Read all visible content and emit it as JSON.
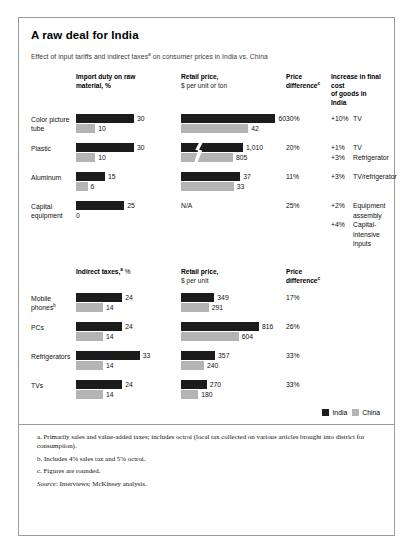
{
  "title": "A raw deal for India",
  "subtitle_parts": {
    "before": "Effect of input tariffs and indirect taxes",
    "sup": "a",
    "after": " on consumer prices in India vs. China"
  },
  "legend": {
    "india_label": "India",
    "china_label": "China",
    "india_color": "#1c1c1c",
    "china_color": "#b4b4b4"
  },
  "section1": {
    "headers": {
      "label": "",
      "bar_a_line1": "Import duty on raw",
      "bar_a_line2": "material, %",
      "bar_b_line1": "Retail price,",
      "bar_b_line2": "$ per unit or ton",
      "diff_line1": "Price",
      "diff_line2": "difference",
      "diff_sup": "c",
      "incr_line1": "Increase in final cost",
      "incr_line2": "of goods in India"
    },
    "rows": [
      {
        "label_line1": "Color picture",
        "label_line2": "tube",
        "duty_india": "30",
        "duty_china": "10",
        "retail_india": "60",
        "retail_china": "42",
        "difference": "30%",
        "increases": [
          {
            "pct": "+10%",
            "text": "TV"
          }
        ]
      },
      {
        "label_line1": "Plastic",
        "label_line2": "",
        "duty_india": "30",
        "duty_china": "10",
        "retail_india": "1,010",
        "retail_china": "805",
        "difference": "20%",
        "increases": [
          {
            "pct": "+1%",
            "text": "TV"
          },
          {
            "pct": "+3%",
            "text": "Refrigerator"
          }
        ]
      },
      {
        "label_line1": "Aluminum",
        "label_line2": "",
        "duty_india": "15",
        "duty_china": "6",
        "retail_india": "37",
        "retail_china": "33",
        "difference": "11%",
        "increases": [
          {
            "pct": "+3%",
            "text": "TV/refrigerator"
          }
        ]
      },
      {
        "label_line1": "Capital",
        "label_line2": "equipment",
        "duty_india": "25",
        "duty_china": "0",
        "retail_na": "N/A",
        "difference": "25%",
        "increases": [
          {
            "pct": "+2%",
            "text": "Equipment assembly"
          },
          {
            "pct": "+4%",
            "text": "Capital-intensive inputs"
          }
        ]
      }
    ]
  },
  "section2": {
    "headers": {
      "bar_a_line1": "Indirect taxes,",
      "bar_a_sup": "a",
      "bar_a_unit": " %",
      "bar_b_line1": "Retail price,",
      "bar_b_line2": "$ per unit",
      "diff_line1": "Price",
      "diff_line2": "difference",
      "diff_sup": "c"
    },
    "rows": [
      {
        "label_line1": "Mobile",
        "label_line2": "phones",
        "label_sup": "b",
        "tax_india": "24",
        "tax_china": "14",
        "retail_india": "349",
        "retail_china": "291",
        "difference": "17%"
      },
      {
        "label_line1": "PCs",
        "label_line2": "",
        "tax_india": "24",
        "tax_china": "14",
        "retail_india": "816",
        "retail_china": "604",
        "difference": "26%"
      },
      {
        "label_line1": "Refrigerators",
        "label_line2": "",
        "tax_india": "33",
        "tax_china": "14",
        "retail_india": "357",
        "retail_china": "240",
        "difference": "33%"
      },
      {
        "label_line1": "TVs",
        "label_line2": "",
        "tax_india": "24",
        "tax_china": "14",
        "retail_india": "270",
        "retail_china": "180",
        "difference": "33%"
      }
    ]
  },
  "footnotes": {
    "a": "a. Primarily sales and value-added taxes; includes octroi (local tax collected on various articles brought into district for consumption).",
    "b": "b. Includes 4% sales tax and 5% octroi.",
    "c": "c. Figures are rounded.",
    "source_label": "Source",
    "source_text": ": Interviews; McKinsey analysis."
  },
  "chart_data": {
    "type": "bar",
    "title": "A raw deal for India",
    "subtitle": "Effect of input tariffs and indirect taxes(a) on consumer prices in India vs. China",
    "series_names": [
      "India",
      "China"
    ],
    "legend_position": "bottom-right",
    "grid": false,
    "panels": [
      {
        "name": "Input tariffs on raw materials",
        "categories": [
          "Color picture tube",
          "Plastic",
          "Aluminum",
          "Capital equipment"
        ],
        "measures": [
          {
            "name": "Import duty on raw material, %",
            "unit": "%",
            "series": [
              {
                "name": "India",
                "values": [
                  30,
                  30,
                  15,
                  25
                ]
              },
              {
                "name": "China",
                "values": [
                  10,
                  10,
                  6,
                  0
                ]
              }
            ]
          },
          {
            "name": "Retail price, $ per unit or ton",
            "unit": "$ per unit or ton",
            "note": "Plastic bars drawn with a scale break",
            "series": [
              {
                "name": "India",
                "values": [
                  60,
                  1010,
                  37,
                  null
                ]
              },
              {
                "name": "China",
                "values": [
                  42,
                  805,
                  33,
                  null
                ]
              }
            ]
          }
        ],
        "price_difference": [
          "30%",
          "20%",
          "11%",
          "25%"
        ],
        "increase_in_final_cost_of_goods_in_india": [
          [
            {
              "pct": "+10%",
              "item": "TV"
            }
          ],
          [
            {
              "pct": "+1%",
              "item": "TV"
            },
            {
              "pct": "+3%",
              "item": "Refrigerator"
            }
          ],
          [
            {
              "pct": "+3%",
              "item": "TV/refrigerator"
            }
          ],
          [
            {
              "pct": "+2%",
              "item": "Equipment assembly"
            },
            {
              "pct": "+4%",
              "item": "Capital-intensive inputs"
            }
          ]
        ]
      },
      {
        "name": "Indirect taxes on finished goods",
        "categories": [
          "Mobile phones",
          "PCs",
          "Refrigerators",
          "TVs"
        ],
        "measures": [
          {
            "name": "Indirect taxes,(a) %",
            "unit": "%",
            "series": [
              {
                "name": "India",
                "values": [
                  24,
                  24,
                  33,
                  24
                ]
              },
              {
                "name": "China",
                "values": [
                  14,
                  14,
                  14,
                  14
                ]
              }
            ]
          },
          {
            "name": "Retail price, $ per unit",
            "unit": "$ per unit",
            "series": [
              {
                "name": "India",
                "values": [
                  349,
                  816,
                  357,
                  270
                ]
              },
              {
                "name": "China",
                "values": [
                  291,
                  604,
                  240,
                  180
                ]
              }
            ]
          }
        ],
        "price_difference": [
          "17%",
          "26%",
          "33%",
          "33%"
        ]
      }
    ]
  }
}
